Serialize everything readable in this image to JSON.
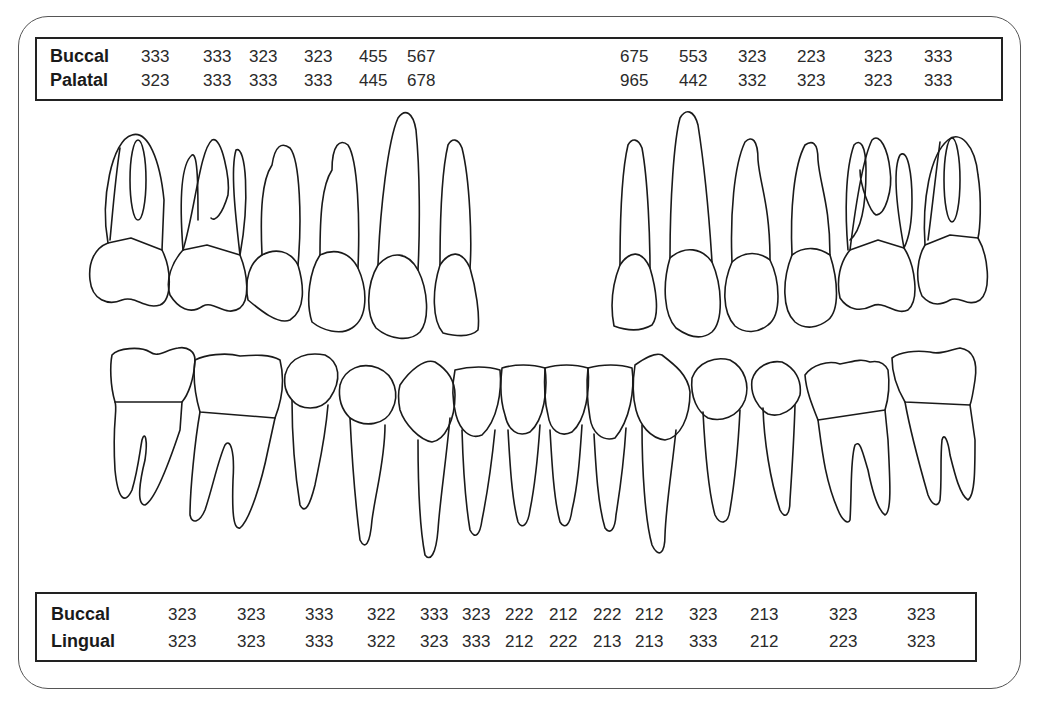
{
  "upper_table": {
    "rows": [
      {
        "label": "Buccal",
        "values": [
          "333",
          "333",
          "323",
          "323",
          "455",
          "567",
          "675",
          "553",
          "323",
          "223",
          "323",
          "333"
        ]
      },
      {
        "label": "Palatal",
        "values": [
          "323",
          "333",
          "333",
          "333",
          "445",
          "678",
          "965",
          "442",
          "332",
          "323",
          "323",
          "333"
        ]
      }
    ]
  },
  "lower_table": {
    "rows": [
      {
        "label": "Buccal",
        "values": [
          "323",
          "323",
          "333",
          "322",
          "333",
          "323",
          "222",
          "212",
          "222",
          "212",
          "323",
          "213",
          "323",
          "323"
        ]
      },
      {
        "label": "Lingual",
        "values": [
          "323",
          "323",
          "333",
          "322",
          "323",
          "333",
          "212",
          "222",
          "213",
          "213",
          "333",
          "212",
          "223",
          "323"
        ]
      }
    ]
  },
  "diagram": {
    "upper_teeth_left": [
      "molar-1",
      "molar-2",
      "premolar-2",
      "premolar-1",
      "canine",
      "lateral-incisor"
    ],
    "upper_teeth_right": [
      "lateral-incisor",
      "canine",
      "premolar-1",
      "premolar-2",
      "molar-2",
      "molar-1"
    ],
    "lower_teeth": [
      "molar-2",
      "molar-1",
      "premolar-2",
      "premolar-1",
      "canine",
      "incisor",
      "incisor",
      "incisor",
      "incisor",
      "canine",
      "premolar-1",
      "premolar-2",
      "molar-1",
      "molar-2"
    ]
  }
}
